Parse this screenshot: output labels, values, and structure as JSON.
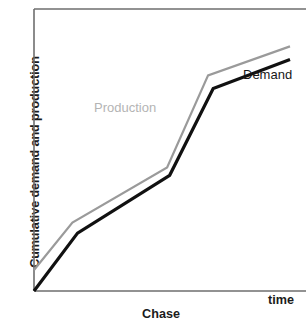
{
  "chart_data": {
    "type": "line",
    "title": "Chase",
    "xlabel": "time",
    "ylabel": "Cumulative demand and production",
    "grid": false,
    "legend_position": "inline-annotation",
    "xlim": [
      0,
      100
    ],
    "ylim": [
      0,
      100
    ],
    "axis_ticks": {
      "x": [],
      "y": []
    },
    "annotations": [
      {
        "text": "Demand",
        "series": "Demand",
        "x": 82,
        "y": 79,
        "color": "#171717"
      },
      {
        "text": "Production",
        "series": "Production",
        "x": 24,
        "y": 67,
        "color": "#b4b4b4"
      }
    ],
    "series": [
      {
        "name": "Demand",
        "color": "#111111",
        "width": 3,
        "points": [
          {
            "x": 0,
            "y": 0
          },
          {
            "x": 17,
            "y": 22
          },
          {
            "x": 53,
            "y": 44
          },
          {
            "x": 70,
            "y": 77
          },
          {
            "x": 100,
            "y": 88
          }
        ]
      },
      {
        "name": "Production",
        "color": "#9a9a9a",
        "width": 2,
        "points": [
          {
            "x": 0,
            "y": 8
          },
          {
            "x": 15,
            "y": 26
          },
          {
            "x": 52,
            "y": 47
          },
          {
            "x": 68,
            "y": 82
          },
          {
            "x": 100,
            "y": 93
          }
        ]
      }
    ]
  },
  "axes": {
    "frame_color": "#6e6e6e",
    "background": "#ffffff"
  }
}
